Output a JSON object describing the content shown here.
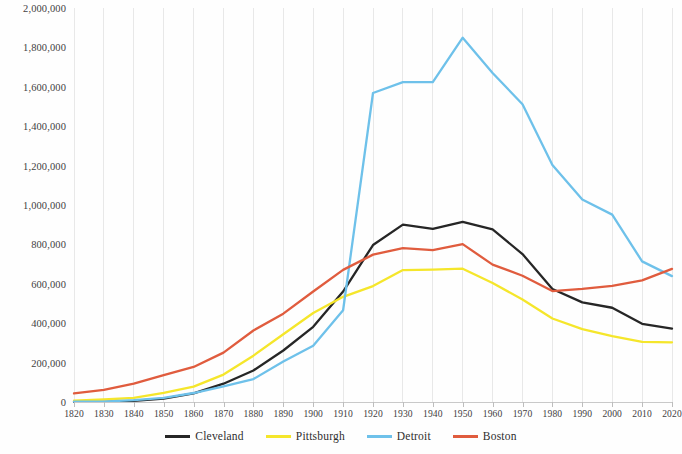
{
  "chart_data": {
    "type": "line",
    "title": "",
    "subtitle": "",
    "xlabel": "",
    "ylabel": "",
    "x": [
      1820,
      1830,
      1840,
      1850,
      1860,
      1870,
      1880,
      1890,
      1900,
      1910,
      1920,
      1930,
      1940,
      1950,
      1960,
      1970,
      1980,
      1990,
      2000,
      2010,
      2020
    ],
    "xlim": [
      1820,
      2020
    ],
    "ylim": [
      0,
      2000000
    ],
    "ytick_labels": [
      "0",
      "200,000",
      "400,000",
      "600,000",
      "800,000",
      "1,000,000",
      "1,200,000",
      "1,400,000",
      "1,600,000",
      "1,800,000",
      "2,000,000"
    ],
    "ytick_values": [
      0,
      200000,
      400000,
      600000,
      800000,
      1000000,
      1200000,
      1400000,
      1600000,
      1800000,
      2000000
    ],
    "xtick_labels": [
      "1820",
      "1830",
      "1840",
      "1850",
      "1860",
      "1870",
      "1880",
      "1890",
      "1900",
      "1910",
      "1920",
      "1930",
      "1940",
      "1950",
      "1960",
      "1970",
      "1980",
      "1990",
      "2000",
      "2010",
      "2020"
    ],
    "grid": {
      "vertical": true,
      "horizontal": false,
      "color": "#e8e8e8"
    },
    "legend_position": "bottom",
    "series": [
      {
        "name": "Cleveland",
        "color": "#262626",
        "values": [
          606,
          1075,
          6071,
          17034,
          43417,
          92829,
          160146,
          261353,
          381768,
          560663,
          796841,
          900429,
          878336,
          914808,
          876050,
          750903,
          573822,
          505616,
          478403,
          396815,
          372624
        ]
      },
      {
        "name": "Pittsburgh",
        "color": "#f5e62b",
        "values": [
          7248,
          12568,
          21115,
          46601,
          77923,
          139256,
          235071,
          343904,
          451512,
          533905,
          588343,
          669817,
          671659,
          676806,
          604332,
          520117,
          423938,
          369879,
          334563,
          305704,
          302971
        ]
      },
      {
        "name": "Detroit",
        "color": "#6ec1ea",
        "values": [
          1422,
          2222,
          9102,
          21019,
          45619,
          79577,
          116340,
          205876,
          285704,
          465766,
          1568662,
          1623452,
          1623452,
          1849568,
          1670144,
          1511482,
          1203339,
          1027974,
          951270,
          713777,
          639111
        ]
      },
      {
        "name": "Boston",
        "color": "#e05c3e",
        "values": [
          43298,
          61392,
          93383,
          136881,
          177840,
          250526,
          362839,
          448477,
          560892,
          670585,
          748060,
          781188,
          770816,
          801444,
          697197,
          641071,
          562994,
          574283,
          589141,
          617594,
          675647
        ]
      }
    ]
  },
  "legend": {
    "items": [
      {
        "label": "Cleveland",
        "color": "#262626"
      },
      {
        "label": "Pittsburgh",
        "color": "#f5e62b"
      },
      {
        "label": "Detroit",
        "color": "#6ec1ea"
      },
      {
        "label": "Boston",
        "color": "#e05c3e"
      }
    ]
  }
}
